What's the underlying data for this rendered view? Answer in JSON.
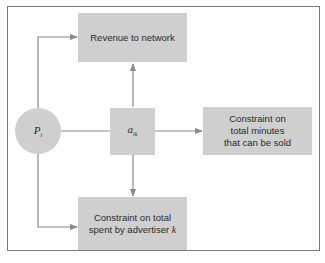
{
  "diagram": {
    "nodes": {
      "price": {
        "symbol": "P",
        "subscript": "i",
        "shape": "circle"
      },
      "allocation": {
        "symbol": "a",
        "subscript": "ik",
        "shape": "box"
      },
      "revenue": {
        "label": "Revenue to network",
        "shape": "box"
      },
      "minutes_constraint": {
        "label_lines": [
          "Constraint on",
          "total minutes",
          "that can be sold"
        ],
        "shape": "box"
      },
      "advertiser_constraint": {
        "label_lines": [
          "Constraint on total",
          "spent by advertiser "
        ],
        "label_var": "k",
        "shape": "box"
      }
    },
    "edges": [
      {
        "from": "price",
        "to": "revenue"
      },
      {
        "from": "price",
        "to": "advertiser_constraint"
      },
      {
        "from": "price",
        "to": "allocation",
        "arrow": false
      },
      {
        "from": "allocation",
        "to": "revenue"
      },
      {
        "from": "allocation",
        "to": "minutes_constraint"
      },
      {
        "from": "allocation",
        "to": "advertiser_constraint"
      }
    ],
    "colors": {
      "node_fill": "#cfcfcf",
      "line": "#8a8a8a",
      "frame": "#7a7a7a"
    }
  }
}
